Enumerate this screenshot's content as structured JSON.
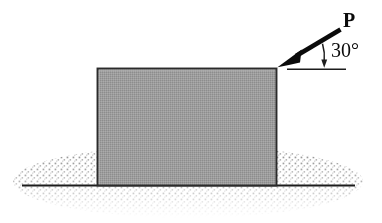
{
  "figure": {
    "background_color": "#ffffff",
    "width": 382,
    "height": 223
  },
  "labels": {
    "force": "P",
    "angle": "30°"
  },
  "block": {
    "name": "block",
    "fill_color": "#9a9a9a",
    "border_color": "#2b2b2b",
    "left": 97,
    "top": 68,
    "right": 277,
    "bottom": 185
  },
  "ground": {
    "name": "ground-surface",
    "line_color": "#1c1c1c",
    "stipple_color": "#9a9a9a",
    "line_y": 185,
    "line_left": 22,
    "line_right": 355
  },
  "force_arrow": {
    "name": "force-vector-P",
    "color": "#0b0b0b",
    "tail_x": 341,
    "tail_y": 29,
    "tip_x": 278,
    "tip_y": 67,
    "angle_degrees": 30
  },
  "reference_line": {
    "name": "horizontal-reference-line",
    "color": "#1c1c1c",
    "y": 69,
    "left": 287,
    "right": 346
  },
  "angle_arc": {
    "name": "angle-arc-30",
    "color": "#1c1c1c",
    "center_x": 278,
    "center_y": 67,
    "radius": 46
  }
}
